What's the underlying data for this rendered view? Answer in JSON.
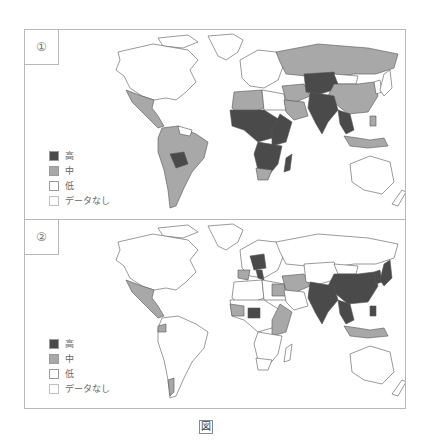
{
  "colors": {
    "high": "#4a4a4a",
    "medium": "#a8a8a8",
    "low": "#ffffff",
    "no_data": "#ffffff",
    "border": "#555555"
  },
  "legend": {
    "items": [
      {
        "key": "high",
        "label": "高"
      },
      {
        "key": "medium",
        "label": "中"
      },
      {
        "key": "low",
        "label": "低"
      },
      {
        "key": "no_data",
        "label": "データなし"
      }
    ]
  },
  "panels": [
    {
      "label": "①",
      "regions": {
        "north_america": "low",
        "greenland": "low",
        "mexico_central_america": "medium",
        "south_america": "medium",
        "bolivia": "high",
        "guianas": "low",
        "europe": "low",
        "russia": "medium",
        "north_africa_west": "medium",
        "egypt_libya": "low",
        "west_central_africa": "high",
        "east_africa": "high",
        "southern_africa": "high",
        "south_africa": "medium",
        "horn_somalia": "low",
        "madagascar": "high",
        "middle_east": "medium",
        "arabian_peninsula": "medium",
        "central_asia": "high",
        "mongolia": "low",
        "china": "medium",
        "south_asia": "high",
        "southeast_asia": "high",
        "indonesia": "medium",
        "japan": "low",
        "australia": "low",
        "new_zealand": "low"
      }
    },
    {
      "label": "②",
      "regions": {
        "north_america": "low",
        "greenland": "low",
        "mexico_central_america": "medium",
        "south_america": "low",
        "ecuador": "medium",
        "chile_south": "medium",
        "europe": "low",
        "central_europe": "high",
        "italy": "high",
        "iberia": "medium",
        "russia": "low",
        "north_africa_west": "low",
        "egypt_libya": "low",
        "west_africa_coast": "medium",
        "nigeria": "high",
        "east_africa": "medium",
        "southern_africa": "low",
        "middle_east": "medium",
        "central_asia": "low",
        "mongolia": "low",
        "china": "high",
        "south_asia": "high",
        "southeast_asia": "high",
        "indonesia": "medium",
        "japan": "high",
        "korea": "high",
        "philippines": "high",
        "australia": "low",
        "new_zealand": "low"
      }
    }
  ],
  "caption": "図"
}
